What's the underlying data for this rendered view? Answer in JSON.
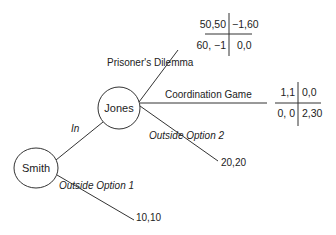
{
  "nodes": {
    "smith": {
      "label": "Smith"
    },
    "jones": {
      "label": "Jones"
    }
  },
  "edges": {
    "in": {
      "label": "In"
    },
    "outside_option_1": {
      "label": "Outside Option 1",
      "payoff": "10,10"
    },
    "outside_option_2": {
      "label": "Outside Option 2",
      "payoff": "20,20"
    },
    "prisoners_dilemma": {
      "label": "Prisoner's Dilemma"
    },
    "coordination_game": {
      "label": "Coordination Game"
    }
  },
  "matrices": {
    "prisoners_dilemma": {
      "cells": [
        [
          "50,50",
          "−1,60"
        ],
        [
          "60, −1",
          "0,0"
        ]
      ]
    },
    "coordination_game": {
      "cells": [
        [
          "1,1",
          "0,0"
        ],
        [
          "0, 0",
          "2,30"
        ]
      ]
    }
  }
}
